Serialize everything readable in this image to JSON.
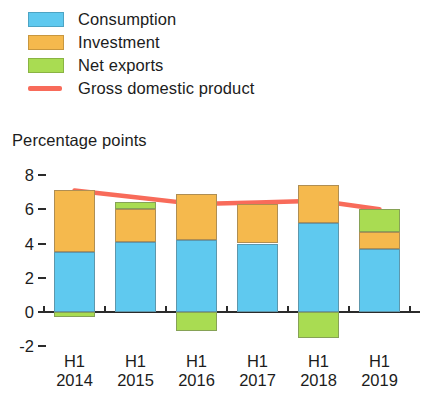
{
  "legend": {
    "items": [
      {
        "label": "Consumption",
        "color": "#5FC9EF",
        "marker": "swatch"
      },
      {
        "label": "Investment",
        "color": "#F5B94D",
        "marker": "swatch"
      },
      {
        "label": "Net exports",
        "color": "#A9DC52",
        "marker": "swatch"
      },
      {
        "label": "Gross domestic product",
        "color": "#F86B5A",
        "marker": "line"
      }
    ]
  },
  "axis_title": "Percentage points",
  "chart_data": {
    "type": "bar",
    "title": "",
    "subtitle": "",
    "stacked": true,
    "xlabel": "",
    "ylabel": "Percentage points",
    "ylim": [
      -2,
      8
    ],
    "yticks": [
      8,
      6,
      4,
      2,
      0,
      -2
    ],
    "ytick_labels": [
      "8",
      "6",
      "4",
      "2",
      "0",
      "-2"
    ],
    "grid": false,
    "legend_position": "top-left",
    "categories": [
      "H1 2014",
      "H1 2015",
      "H1 2016",
      "H1 2017",
      "H1 2018",
      "H1 2019"
    ],
    "category_lines": [
      [
        "H1",
        "2014"
      ],
      [
        "H1",
        "2015"
      ],
      [
        "H1",
        "2016"
      ],
      [
        "H1",
        "2017"
      ],
      [
        "H1",
        "2018"
      ],
      [
        "H1",
        "2019"
      ]
    ],
    "series": [
      {
        "name": "Consumption",
        "color": "#5FC9EF",
        "values": [
          3.5,
          4.1,
          4.2,
          4.0,
          5.2,
          3.7
        ]
      },
      {
        "name": "Investment",
        "color": "#F5B94D",
        "values": [
          3.6,
          1.9,
          2.7,
          2.3,
          2.2,
          1.0
        ]
      },
      {
        "name": "Net exports",
        "color": "#A9DC52",
        "values": [
          -0.3,
          0.4,
          -1.1,
          0.0,
          -1.5,
          1.3
        ]
      }
    ],
    "line_series": {
      "name": "Gross domestic product",
      "color": "#F86B5A",
      "values": [
        7.1,
        6.7,
        6.3,
        6.4,
        6.5,
        6.0
      ]
    }
  }
}
